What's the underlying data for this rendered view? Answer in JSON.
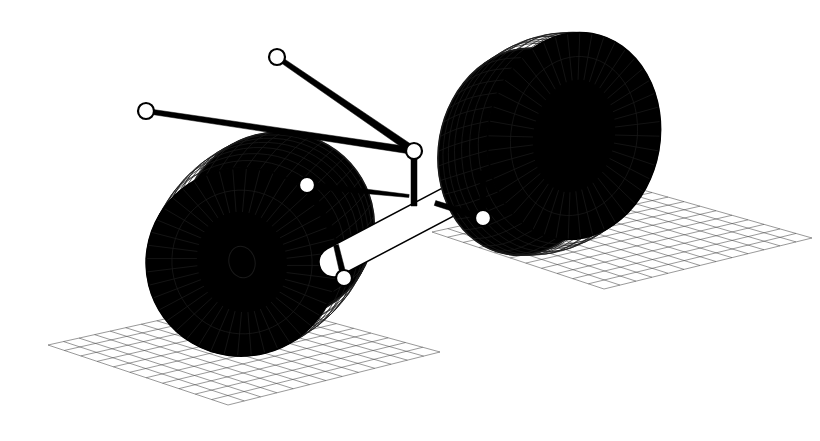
{
  "figure": {
    "kind": "wireframe-3d-technical-illustration",
    "background_color": "#ffffff",
    "line_color": "#000000",
    "surface_fill": "#ffffff",
    "canvas": {
      "width": 820,
      "height": 441
    }
  },
  "style": {
    "mesh_stroke": "#1a1a1a",
    "mesh_stroke_width": 0.7,
    "grid_stroke": "#444444",
    "grid_stroke_width": 0.55,
    "outline_stroke": "#000000",
    "outline_stroke_width": 1.6,
    "rod_color": "#000000",
    "joint_fill": "#ffffff",
    "joint_stroke": "#000000",
    "joint_stroke_width": 2.2,
    "joint_radius": 8
  },
  "ground_planes": [
    {
      "name": "left-ground-grid",
      "corners": [
        [
          48,
          345
        ],
        [
          250,
          300
        ],
        [
          440,
          352
        ],
        [
          228,
          405
        ]
      ],
      "cells_u": 13,
      "cells_v": 11
    },
    {
      "name": "right-ground-grid",
      "corners": [
        [
          432,
          232
        ],
        [
          636,
          188
        ],
        [
          812,
          238
        ],
        [
          604,
          289
        ]
      ],
      "cells_u": 13,
      "cells_v": 11
    }
  ],
  "wheels": [
    {
      "name": "left-wheel",
      "center": [
        242,
        262
      ],
      "outer_rx": 96,
      "outer_ry": 94,
      "rotation_deg": -14,
      "hub_rx": 44,
      "hub_ry": 50,
      "bore_rx": 13,
      "bore_ry": 16,
      "tread_bands": 7,
      "spokes": 44,
      "depth_offset": [
        44,
        -26
      ],
      "view": "face-on-left"
    },
    {
      "name": "right-wheel",
      "center": [
        574,
        136
      ],
      "outer_rx": 86,
      "outer_ry": 104,
      "rotation_deg": 10,
      "hub_rx": 40,
      "hub_ry": 56,
      "bore_rx": 0,
      "bore_ry": 0,
      "tread_bands": 7,
      "spokes": 44,
      "depth_offset": [
        -46,
        24
      ],
      "view": "face-on-right"
    }
  ],
  "axle": {
    "name": "axle-tube",
    "start": [
      334,
      262
    ],
    "end": [
      566,
      140
    ],
    "radius": 15,
    "fill": "#ffffff",
    "stroke": "#000000"
  },
  "joints": [
    {
      "id": "j1",
      "name": "joint-upper-left-tie-rod-end",
      "x": 146,
      "y": 111,
      "r": 8
    },
    {
      "id": "j2",
      "name": "joint-upper-top-tie-rod-end",
      "x": 277,
      "y": 57,
      "r": 8
    },
    {
      "id": "j3",
      "name": "joint-center-knuckle",
      "x": 414,
      "y": 151,
      "r": 8
    },
    {
      "id": "j4",
      "name": "joint-upper-control-arm-pivot",
      "x": 307,
      "y": 185,
      "r": 8
    },
    {
      "id": "j5",
      "name": "joint-lower-control-arm-pivot",
      "x": 344,
      "y": 278,
      "r": 8
    },
    {
      "id": "j6",
      "name": "joint-right-drop-link-base",
      "x": 483,
      "y": 218,
      "r": 8
    }
  ],
  "links": [
    {
      "name": "link-tie-rod-left",
      "from": "j1",
      "to": "j3",
      "w_from": 5.0,
      "w_to": 7.0
    },
    {
      "name": "link-tie-rod-top",
      "from": "j2",
      "to": "j3",
      "w_from": 5.0,
      "w_to": 8.0
    },
    {
      "name": "link-center-post",
      "from": [
        414,
        151
      ],
      "to": [
        414,
        206
      ],
      "w_from": 6.0,
      "w_to": 6.0
    },
    {
      "name": "link-upper-arm",
      "from": "j4",
      "to": [
        409,
        196
      ],
      "w_from": 6.5,
      "w_to": 3.0
    },
    {
      "name": "link-upper-arm-strut",
      "from": "j4",
      "to": [
        332,
        232
      ],
      "w_from": 6.0,
      "w_to": 5.0
    },
    {
      "name": "link-lower-strut",
      "from": "j5",
      "to": [
        336,
        245
      ],
      "w_from": 6.0,
      "w_to": 5.0
    },
    {
      "name": "link-right-drop-post",
      "from": "j6",
      "to": [
        483,
        171
      ],
      "w_from": 5.5,
      "w_to": 5.5
    },
    {
      "name": "link-right-lower-arm",
      "from": "j6",
      "to": [
        435,
        203
      ],
      "w_from": 6.0,
      "w_to": 5.0
    }
  ]
}
